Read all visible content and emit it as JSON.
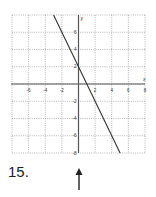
{
  "problem": {
    "number_label": "15."
  },
  "chart_data": {
    "type": "line",
    "title": "",
    "xlabel": "x",
    "ylabel": "y",
    "xlim": [
      -8,
      8
    ],
    "ylim": [
      -8,
      8
    ],
    "grid": true,
    "grid_style": "dotted",
    "x_ticks": [
      -6,
      -4,
      -2,
      2,
      4,
      6,
      8
    ],
    "x_tick_labels": [
      "-6",
      "-4",
      "-2",
      "2",
      "4",
      "6",
      "8"
    ],
    "y_ticks": [
      6,
      4,
      2,
      -2,
      -4,
      -6,
      -8
    ],
    "y_tick_labels": [
      "6",
      "4",
      "2",
      "-2",
      "-4",
      "-6",
      "-8"
    ],
    "series": [
      {
        "name": "line",
        "equation": "y = -2x + 2",
        "x": [
          -3,
          5
        ],
        "y": [
          8,
          -8
        ]
      }
    ],
    "key_points": [
      {
        "label": "y-intercept",
        "x": 0,
        "y": 2
      },
      {
        "label": "x-intercept",
        "x": 1,
        "y": 0
      }
    ],
    "legend": []
  },
  "icons": {
    "arrow": "up-arrow-icon"
  },
  "colors": {
    "line": "#333333",
    "axis": "#555555",
    "grid": "#9a9a9a",
    "text": "#333333"
  }
}
